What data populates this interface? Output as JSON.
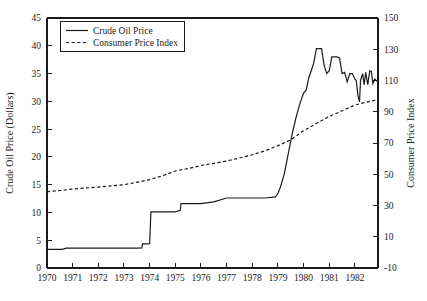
{
  "chart_data": {
    "type": "line",
    "title": "",
    "xlabel": "",
    "ylabel": "Crude Oil Price (Dollars)",
    "y2label": "Consumer Price Index",
    "xlim": [
      1970.0,
      1982.9
    ],
    "ylim": [
      0,
      45
    ],
    "y2lim": [
      -10,
      150
    ],
    "grid": false,
    "legend_position": "top-left",
    "x_ticks": [
      "1970",
      "1971",
      "1972",
      "1973",
      "1974",
      "1975",
      "1976",
      "1977",
      "1978",
      "1979",
      "1980",
      "1981",
      "1982"
    ],
    "y_ticks": [
      "0",
      "5",
      "10",
      "15",
      "20",
      "25",
      "30",
      "35",
      "40",
      "45"
    ],
    "y2_ticks": [
      "-10",
      "10",
      "30",
      "50",
      "70",
      "90",
      "110",
      "130",
      "150"
    ],
    "legend": [
      {
        "name": "Crude Oil Price",
        "style": "solid"
      },
      {
        "name": "Consumer Price Index",
        "style": "dashed"
      }
    ],
    "series": [
      {
        "name": "Crude Oil Price",
        "style": "solid",
        "axis": "left",
        "units": "Dollars",
        "points": [
          [
            1970.0,
            3.35
          ],
          [
            1970.6,
            3.35
          ],
          [
            1970.75,
            3.56
          ],
          [
            1971.0,
            3.56
          ],
          [
            1972.0,
            3.56
          ],
          [
            1973.0,
            3.56
          ],
          [
            1973.5,
            3.56
          ],
          [
            1973.7,
            3.6
          ],
          [
            1973.72,
            4.35
          ],
          [
            1973.95,
            4.35
          ],
          [
            1974.0,
            4.4
          ],
          [
            1974.05,
            10.1
          ],
          [
            1974.3,
            10.1
          ],
          [
            1974.6,
            10.1
          ],
          [
            1975.0,
            10.1
          ],
          [
            1975.2,
            10.4
          ],
          [
            1975.22,
            11.6
          ],
          [
            1975.8,
            11.6
          ],
          [
            1976.0,
            11.6
          ],
          [
            1976.5,
            11.9
          ],
          [
            1977.0,
            12.6
          ],
          [
            1977.4,
            12.6
          ],
          [
            1978.0,
            12.6
          ],
          [
            1978.5,
            12.6
          ],
          [
            1978.9,
            12.8
          ],
          [
            1979.0,
            13.4
          ],
          [
            1979.1,
            14.6
          ],
          [
            1979.25,
            17.0
          ],
          [
            1979.4,
            20.5
          ],
          [
            1979.55,
            24.0
          ],
          [
            1979.7,
            27.0
          ],
          [
            1979.85,
            29.5
          ],
          [
            1980.0,
            31.5
          ],
          [
            1980.1,
            32.0
          ],
          [
            1980.2,
            34.2
          ],
          [
            1980.3,
            35.5
          ],
          [
            1980.4,
            37.0
          ],
          [
            1980.5,
            39.5
          ],
          [
            1980.6,
            39.5
          ],
          [
            1980.7,
            39.5
          ],
          [
            1980.8,
            36.5
          ],
          [
            1980.9,
            35.0
          ],
          [
            1981.0,
            35.5
          ],
          [
            1981.1,
            38.0
          ],
          [
            1981.2,
            38.0
          ],
          [
            1981.3,
            38.0
          ],
          [
            1981.4,
            37.8
          ],
          [
            1981.5,
            35.0
          ],
          [
            1981.6,
            35.2
          ],
          [
            1981.7,
            33.5
          ],
          [
            1981.8,
            35.0
          ],
          [
            1981.9,
            35.0
          ],
          [
            1982.0,
            34.0
          ],
          [
            1982.05,
            33.8
          ],
          [
            1982.12,
            31.0
          ],
          [
            1982.18,
            29.9
          ],
          [
            1982.22,
            33.8
          ],
          [
            1982.3,
            35.0
          ],
          [
            1982.36,
            33.0
          ],
          [
            1982.42,
            35.2
          ],
          [
            1982.5,
            33.0
          ],
          [
            1982.58,
            35.5
          ],
          [
            1982.64,
            35.4
          ],
          [
            1982.7,
            33.2
          ],
          [
            1982.78,
            34.0
          ],
          [
            1982.86,
            33.6
          ]
        ]
      },
      {
        "name": "Consumer Price Index",
        "style": "dashed",
        "axis": "right",
        "units": "index",
        "points": [
          [
            1970.0,
            38.8
          ],
          [
            1970.5,
            39.6
          ],
          [
            1971.0,
            40.5
          ],
          [
            1971.5,
            41.2
          ],
          [
            1972.0,
            41.8
          ],
          [
            1972.5,
            42.5
          ],
          [
            1973.0,
            43.3
          ],
          [
            1973.5,
            44.8
          ],
          [
            1974.0,
            46.6
          ],
          [
            1974.5,
            49.0
          ],
          [
            1975.0,
            52.1
          ],
          [
            1975.5,
            53.6
          ],
          [
            1976.0,
            55.6
          ],
          [
            1976.5,
            57.0
          ],
          [
            1977.0,
            58.5
          ],
          [
            1977.5,
            60.4
          ],
          [
            1978.0,
            62.5
          ],
          [
            1978.5,
            65.0
          ],
          [
            1979.0,
            68.3
          ],
          [
            1979.5,
            72.0
          ],
          [
            1980.0,
            77.8
          ],
          [
            1980.5,
            82.5
          ],
          [
            1981.0,
            87.0
          ],
          [
            1981.5,
            90.6
          ],
          [
            1982.0,
            94.3
          ],
          [
            1982.4,
            96.0
          ],
          [
            1982.86,
            97.6
          ]
        ]
      }
    ]
  }
}
